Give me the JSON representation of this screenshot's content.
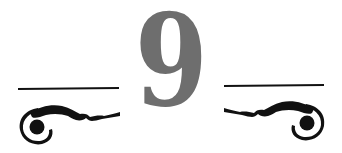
{
  "chapter": {
    "number": "9"
  },
  "colors": {
    "number": "#6e6e6e",
    "ornament": "#111111",
    "background": "#ffffff"
  },
  "icons": {
    "left_ornament": "scroll-flourish-left-icon",
    "right_ornament": "scroll-flourish-right-icon"
  }
}
